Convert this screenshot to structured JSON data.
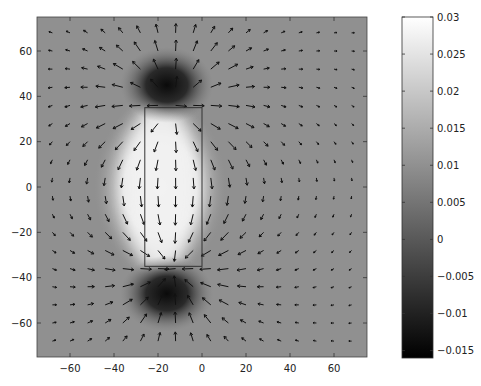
{
  "chart_data": {
    "type": "heatmap",
    "subtype": "heatmap-with-quiver",
    "title": "",
    "xlabel": "",
    "ylabel": "",
    "xlim": [
      -75,
      75
    ],
    "ylim": [
      -75,
      75
    ],
    "grid": false,
    "x_ticks": [
      -60,
      -40,
      -20,
      0,
      20,
      40,
      60
    ],
    "y_ticks": [
      60,
      40,
      20,
      0,
      -20,
      -40,
      -60
    ],
    "x_tick_labels": [
      "−60",
      "−40",
      "−20",
      "0",
      "20",
      "40",
      "60"
    ],
    "y_tick_labels": [
      "60",
      "40",
      "20",
      "0",
      "−20",
      "−40",
      "−60"
    ],
    "colormap": "gray",
    "colorbar": {
      "position": "right",
      "range": [
        -0.016,
        0.03
      ],
      "ticks": [
        0.03,
        0.025,
        0.02,
        0.015,
        0.01,
        0.005,
        0,
        -0.005,
        -0.01,
        -0.015
      ],
      "tick_labels": [
        "0.03",
        "0.025",
        "0.02",
        "0.015",
        "0.01",
        "0.005",
        "0",
        "−0.005",
        "−0.01",
        "−0.015"
      ]
    },
    "background_value": 0.0,
    "features": [
      {
        "kind": "bright-region",
        "center": [
          -19,
          0
        ],
        "extent_x": [
          -30,
          0
        ],
        "extent_y": [
          -32,
          32
        ],
        "value": 0.03
      },
      {
        "kind": "dark-spot",
        "center": [
          -16,
          45
        ],
        "radius": 12,
        "value": -0.016
      },
      {
        "kind": "dark-spot",
        "center": [
          -16,
          -47
        ],
        "radius": 12,
        "value": -0.016
      }
    ],
    "rectangle": {
      "x": [
        -26,
        0
      ],
      "y": [
        -35,
        35
      ],
      "stroke": "#333333"
    },
    "quiver": {
      "grid_x_start": -68,
      "grid_x_step": 8,
      "grid_x_count": 18,
      "grid_y_start": 68,
      "grid_y_step": -8,
      "grid_y_count": 18,
      "arrow_color": "#111111",
      "description": "Arrows point outward from the bright region and bend toward the dark spots; vertical near the box ends, horizontal near y=0."
    }
  }
}
